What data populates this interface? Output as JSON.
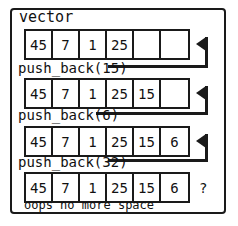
{
  "diagram": {
    "title": "vector",
    "caption": "oops no more space",
    "overflow_marker": "?",
    "colors": {
      "stroke": "#1a1a1a",
      "background": "#ffffff",
      "text": "#111111"
    },
    "rows": [
      {
        "name": "state-initial",
        "cells": [
          "45",
          "7",
          "1",
          "25",
          "",
          ""
        ],
        "capacity": 6,
        "size": 4,
        "has_arrow": true
      },
      {
        "name": "state-after-push-15",
        "cells": [
          "45",
          "7",
          "1",
          "25",
          "15",
          ""
        ],
        "capacity": 6,
        "size": 5,
        "has_arrow": true
      },
      {
        "name": "state-after-push-6",
        "cells": [
          "45",
          "7",
          "1",
          "25",
          "15",
          "6"
        ],
        "capacity": 6,
        "size": 6,
        "has_arrow": true
      },
      {
        "name": "state-after-push-32",
        "cells": [
          "45",
          "7",
          "1",
          "25",
          "15",
          "6"
        ],
        "capacity": 6,
        "size": 6,
        "has_arrow": false
      }
    ],
    "operations": [
      {
        "name": "push-back-15",
        "label": "push_back(15)"
      },
      {
        "name": "push-back-6",
        "label": "push_back(6)"
      },
      {
        "name": "push-back-32",
        "label": "push_back(32)"
      }
    ]
  }
}
